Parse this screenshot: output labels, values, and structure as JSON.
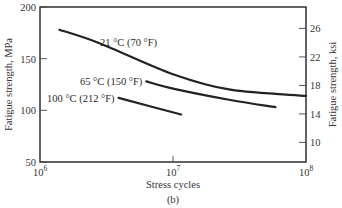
{
  "chart_data": {
    "type": "line",
    "title": "",
    "caption": "(b)",
    "xlabel": "Stress cycles",
    "ylabel": "Fatigue strength, MPa",
    "y2label": "Fatigue strength, ksi",
    "xscale": "log",
    "xlim": [
      1000000,
      100000000
    ],
    "ylim": [
      50,
      200
    ],
    "y2lim_ksi": [
      7.25,
      29.0
    ],
    "grid": false,
    "x_ticks": [
      {
        "value": 1000000,
        "base": "10",
        "exp": "6"
      },
      {
        "value": 10000000,
        "base": "10",
        "exp": "7"
      },
      {
        "value": 100000000,
        "base": "10",
        "exp": "8"
      }
    ],
    "y_ticks": [
      "50",
      "100",
      "150",
      "200"
    ],
    "y2_ticks": [
      "10",
      "14",
      "18",
      "22",
      "26"
    ],
    "series": [
      {
        "name": "21 °C (70 °F)",
        "x": [
          1400000,
          2800000,
          10000000,
          27000000,
          100000000
        ],
        "y": [
          178,
          165,
          135,
          120,
          114
        ]
      },
      {
        "name": "65 °C (150 °F)",
        "x": [
          6300000,
          10000000,
          27000000,
          59000000
        ],
        "y": [
          128,
          121,
          110,
          103
        ]
      },
      {
        "name": "100 °C (212 °F)",
        "x": [
          3900000,
          11500000
        ],
        "y": [
          112,
          96
        ]
      }
    ]
  }
}
